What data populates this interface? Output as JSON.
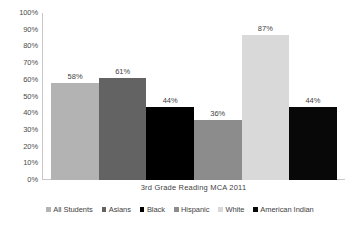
{
  "chart_data": {
    "type": "bar",
    "title": "",
    "xlabel": "3rd Grade  Reading MCA 2011",
    "ylabel": "",
    "ylim": [
      0,
      100
    ],
    "grid": false,
    "legend_position": "bottom",
    "categories": [
      "All Students",
      "Asians",
      "Black",
      "Hispanic",
      "White",
      "American Indian"
    ],
    "values": [
      58,
      61,
      44,
      36,
      87,
      44
    ],
    "value_labels": [
      "58%",
      "61%",
      "44%",
      "36%",
      "87%",
      "44%"
    ],
    "colors": [
      "#b3b3b3",
      "#636363",
      "#000000",
      "#8c8c8c",
      "#d9d9d9",
      "#080808"
    ],
    "y_ticks": [
      "100%",
      "90%",
      "80%",
      "70%",
      "60%",
      "50%",
      "40%",
      "30%",
      "20%",
      "10%",
      "0%"
    ],
    "y_tick_values": [
      100,
      90,
      80,
      70,
      60,
      50,
      40,
      30,
      20,
      10,
      0
    ],
    "series": [
      {
        "name": "3rd Grade Reading MCA 2011",
        "values": [
          58,
          61,
          44,
          36,
          87,
          44
        ]
      }
    ],
    "legend": [
      {
        "label": "All Students",
        "color": "#b3b3b3"
      },
      {
        "label": "Asians",
        "color": "#636363"
      },
      {
        "label": "Black",
        "color": "#000000"
      },
      {
        "label": "Hispanic",
        "color": "#8c8c8c"
      },
      {
        "label": "White",
        "color": "#d9d9d9"
      },
      {
        "label": "American Indian",
        "color": "#080808"
      }
    ]
  }
}
